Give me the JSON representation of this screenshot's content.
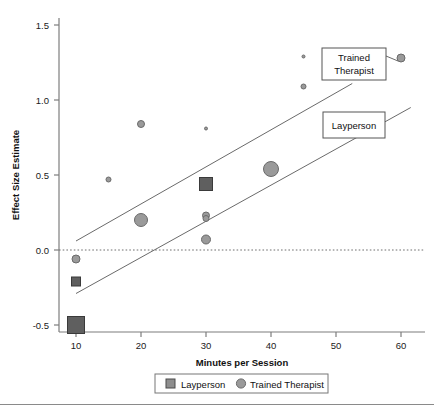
{
  "figure": {
    "background": "#ffffff",
    "axis_color": "#7d7d7d",
    "text_color": "#111111"
  },
  "chart_data": {
    "type": "scatter",
    "title": "",
    "xlabel": "Minutes per Session",
    "ylabel": "Effect Size Estimate",
    "xlim": [
      5,
      63
    ],
    "ylim": [
      -0.62,
      1.62
    ],
    "xticks": [
      10,
      20,
      30,
      40,
      50,
      60
    ],
    "xticklabels": [
      "10",
      "20",
      "30",
      "40",
      "50",
      "60"
    ],
    "yticks": [
      -0.5,
      0.0,
      0.5,
      1.0,
      1.5
    ],
    "yticklabels": [
      "-0.5",
      "0.0",
      "0.5",
      "1.0",
      "1.5"
    ],
    "grid": false,
    "reference_line": {
      "y": 0.0,
      "style": "dotted",
      "color": "#6e6e6e"
    },
    "legend": {
      "position": "below-axis",
      "entries": [
        {
          "label": "Layperson",
          "marker": "square",
          "color": "#6b6b6b"
        },
        {
          "label": "Trained Therapist",
          "marker": "circle",
          "color": "#9a9a9a"
        }
      ]
    },
    "series": [
      {
        "name": "Layperson",
        "marker": "square",
        "color": "#5f5f5f",
        "edge_color": "#3a3a3a",
        "points": [
          {
            "x": 10,
            "y": -0.5,
            "size": 17
          },
          {
            "x": 10,
            "y": -0.21,
            "size": 9
          },
          {
            "x": 30,
            "y": 0.44,
            "size": 13
          }
        ]
      },
      {
        "name": "Trained Therapist",
        "marker": "circle",
        "color": "#9a9a9a",
        "edge_color": "#6a6a6a",
        "points": [
          {
            "x": 10,
            "y": -0.06,
            "size": 8
          },
          {
            "x": 15,
            "y": 0.47,
            "size": 5
          },
          {
            "x": 20,
            "y": 0.84,
            "size": 7
          },
          {
            "x": 20,
            "y": 0.2,
            "size": 13
          },
          {
            "x": 30,
            "y": 0.81,
            "size": 3
          },
          {
            "x": 30,
            "y": 0.23,
            "size": 7
          },
          {
            "x": 30,
            "y": 0.21,
            "size": 6
          },
          {
            "x": 30,
            "y": 0.07,
            "size": 9
          },
          {
            "x": 40,
            "y": 0.54,
            "size": 15
          },
          {
            "x": 45,
            "y": 1.29,
            "size": 3
          },
          {
            "x": 45,
            "y": 1.09,
            "size": 5
          },
          {
            "x": 60,
            "y": 1.28,
            "size": 8
          }
        ]
      }
    ],
    "trend_lines": [
      {
        "name": "Trained Therapist",
        "color": "#6a6a6a",
        "x_start": 10,
        "y_start": 0.06,
        "x_end": 52.5,
        "y_end": 1.11
      },
      {
        "name": "Layperson",
        "color": "#6a6a6a",
        "x_start": 10,
        "y_start": -0.29,
        "x_end": 61.5,
        "y_end": 0.95
      }
    ],
    "annotations": [
      {
        "id": "trained-therapist-callout",
        "label_line_1": "Trained",
        "label_line_2": "Therapist",
        "box": {
          "x": 322,
          "y": 48,
          "w": 64,
          "h": 32
        },
        "leader_to": {
          "x": 397,
          "y": 62
        }
      },
      {
        "id": "layperson-callout",
        "label_line_1": "Layperson",
        "label_line_2": "",
        "box": {
          "x": 323,
          "y": 112,
          "w": 62,
          "h": 26
        },
        "leader_to": {
          "x": 398,
          "y": 103
        }
      }
    ]
  }
}
